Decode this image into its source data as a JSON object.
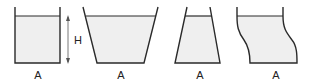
{
  "diagram": {
    "colors": {
      "line": "#2a2a2a",
      "water": "#efefef",
      "text": "#222222"
    },
    "containers": [
      {
        "id": "cylinder",
        "base_label": "A",
        "shape": "straight-walls"
      },
      {
        "id": "widening",
        "base_label": "A",
        "shape": "flared-outward"
      },
      {
        "id": "narrowing",
        "base_label": "A",
        "shape": "tapered-inward"
      },
      {
        "id": "curved",
        "base_label": "A",
        "shape": "s-curved-walls"
      }
    ],
    "height_marker": {
      "label": "H"
    }
  }
}
